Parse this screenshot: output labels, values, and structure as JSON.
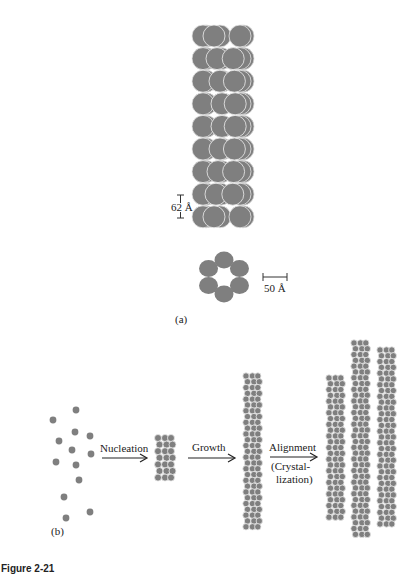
{
  "figure": {
    "caption": "Figure 2-21",
    "panel_a": {
      "label": "(a)",
      "fiber_scale_label": "62 Å",
      "ring_scale_label": "50 Å",
      "fiber_rows": 9,
      "fiber_circles_per_row": 3,
      "ring_subunits": 6
    },
    "panel_b": {
      "label": "(b)",
      "steps": [
        {
          "label": "Nucleation"
        },
        {
          "label": "Growth"
        },
        {
          "label": "Alignment",
          "sublabel_1": "(Crystal-",
          "sublabel_2": "lization)"
        }
      ]
    },
    "colors": {
      "subunit_fill": "#7f7f7f",
      "subunit_edge": "#e6e6e6",
      "text": "#222222",
      "background": "#ffffff"
    }
  }
}
